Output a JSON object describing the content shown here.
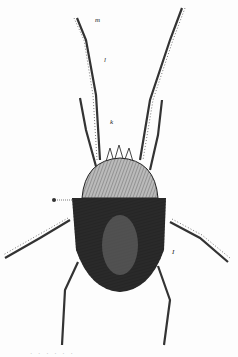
{
  "figure": {
    "labels": {
      "m": "m",
      "l": "l",
      "k": "k",
      "g": "g",
      "side": "I"
    },
    "caption": "· · · · · ·"
  }
}
